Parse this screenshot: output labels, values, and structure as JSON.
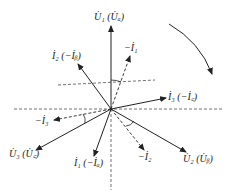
{
  "diagram": {
    "type": "phasor-diagram",
    "origin": [
      111,
      109
    ],
    "rotation_arrow": "clockwise",
    "labels": {
      "u1": "U̇₁ (U̇ₐ)",
      "u2": "U̇₂ (U̇ᵦ)",
      "u3": "U̇₃ (U̇꜀)",
      "i1": "İ₁ (−İₐ)",
      "i2": "İ₂ (−İᵦ)",
      "i3": "İ₃ (−İ꜀)",
      "neg_i1": "−İ₁",
      "neg_i2": "−İ₂",
      "neg_i3": "−İ₃"
    },
    "phasors": [
      {
        "name": "U1",
        "style": "solid",
        "end": [
          111,
          26
        ]
      },
      {
        "name": "U2",
        "style": "solid",
        "end": [
          186,
          152
        ]
      },
      {
        "name": "U3",
        "style": "solid",
        "end": [
          36,
          150
        ]
      },
      {
        "name": "I1",
        "style": "solid",
        "end": [
          94,
          156
        ]
      },
      {
        "name": "I2",
        "style": "solid",
        "end": [
          78,
          64
        ]
      },
      {
        "name": "I3",
        "style": "solid",
        "end": [
          166,
          98
        ]
      },
      {
        "name": "-I1",
        "style": "dashed",
        "end": [
          130,
          56
        ]
      },
      {
        "name": "-I2",
        "style": "dashed",
        "end": [
          144,
          150
        ]
      },
      {
        "name": "-I3",
        "style": "dashed",
        "end": [
          54,
          120
        ]
      }
    ]
  }
}
